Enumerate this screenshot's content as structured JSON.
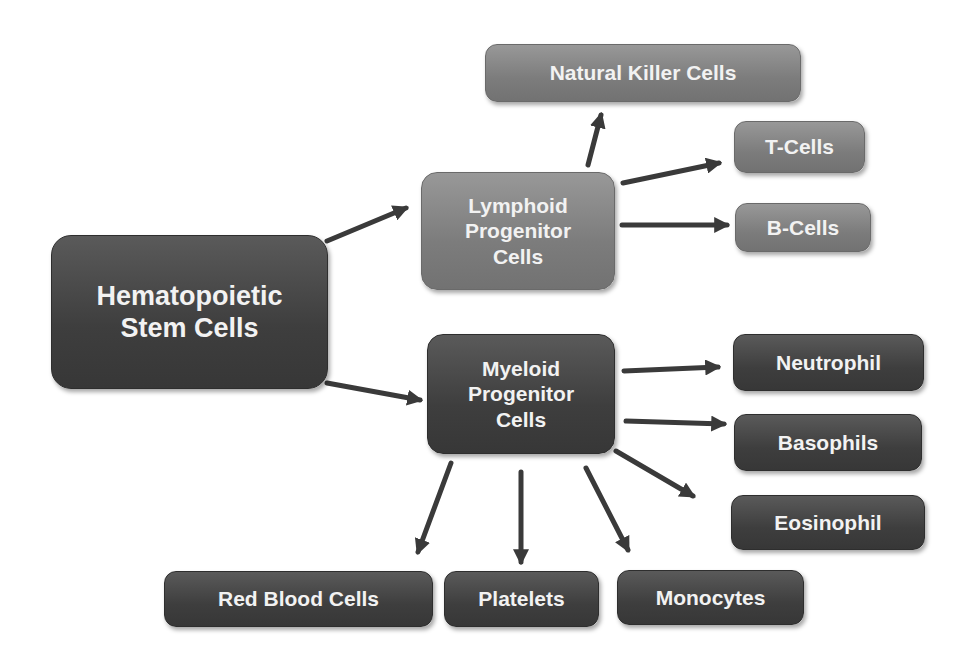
{
  "diagram": {
    "colors": {
      "dark_node": "#3f3f3f",
      "mid_node": "#7e7e7e",
      "arrow": "#3a3a3a",
      "text": "#f2f2f2"
    },
    "nodes": {
      "hsc": {
        "label": "Hematopoietic\nStem Cells"
      },
      "lymphoid": {
        "label": "Lymphoid\nProgenitor\nCells"
      },
      "myeloid": {
        "label": "Myeloid\nProgenitor\nCells"
      },
      "nk": {
        "label": "Natural Killer Cells"
      },
      "t_cells": {
        "label": "T-Cells"
      },
      "b_cells": {
        "label": "B-Cells"
      },
      "neutrophil": {
        "label": "Neutrophil"
      },
      "basophils": {
        "label": "Basophils"
      },
      "eosinophil": {
        "label": "Eosinophil"
      },
      "rbc": {
        "label": "Red Blood Cells"
      },
      "platelets": {
        "label": "Platelets"
      },
      "monocytes": {
        "label": "Monocytes"
      }
    },
    "edges": [
      {
        "from": "Hematopoietic Stem Cells",
        "to": "Lymphoid Progenitor Cells"
      },
      {
        "from": "Hematopoietic Stem Cells",
        "to": "Myeloid Progenitor Cells"
      },
      {
        "from": "Lymphoid Progenitor Cells",
        "to": "Natural Killer Cells"
      },
      {
        "from": "Lymphoid Progenitor Cells",
        "to": "T-Cells"
      },
      {
        "from": "Lymphoid Progenitor Cells",
        "to": "B-Cells"
      },
      {
        "from": "Myeloid Progenitor Cells",
        "to": "Neutrophil"
      },
      {
        "from": "Myeloid Progenitor Cells",
        "to": "Basophils"
      },
      {
        "from": "Myeloid Progenitor Cells",
        "to": "Eosinophil"
      },
      {
        "from": "Myeloid Progenitor Cells",
        "to": "Red Blood Cells"
      },
      {
        "from": "Myeloid Progenitor Cells",
        "to": "Platelets"
      },
      {
        "from": "Myeloid Progenitor Cells",
        "to": "Monocytes"
      }
    ]
  }
}
